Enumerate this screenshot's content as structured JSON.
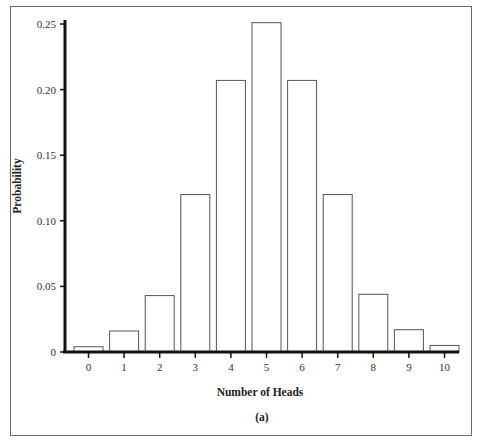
{
  "chart_data": {
    "type": "bar",
    "title": "",
    "caption": "(a)",
    "xlabel": "Number of Heads",
    "ylabel": "Probability",
    "categories": [
      "0",
      "1",
      "2",
      "3",
      "4",
      "5",
      "6",
      "7",
      "8",
      "9",
      "10"
    ],
    "values": [
      0.004,
      0.016,
      0.043,
      0.12,
      0.207,
      0.251,
      0.207,
      0.12,
      0.044,
      0.017,
      0.005
    ],
    "ylim": [
      0,
      0.25
    ],
    "yticks": [
      "0",
      "0.05",
      "0.10",
      "0.15",
      "0.20",
      "0.25"
    ],
    "grid": false,
    "legend": null,
    "bar_fill": "#ffffff",
    "bar_stroke": "#555555",
    "axis_color": "#111111"
  }
}
